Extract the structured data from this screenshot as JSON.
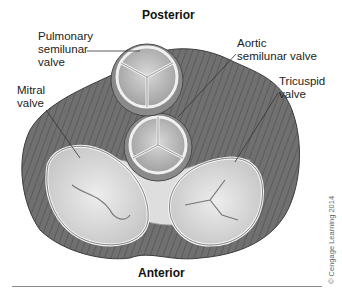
{
  "figure": {
    "orientation_top": "Posterior",
    "orientation_bottom": "Anterior",
    "credit": "© Cengage Learning 2014",
    "labels": {
      "pulmonary": "Pulmonary\nsemilunar\nvalve",
      "aortic": "Aortic\nsemilunar valve",
      "mitral": "Mitral\nvalve",
      "tricuspid": "Tricuspid\nvalve"
    },
    "colors": {
      "muscle": "#6e6e6e",
      "muscle_stripe": "#4f4f4f",
      "skeleton": "#d6d6d6",
      "valve_face": "#c9c9c9",
      "valve_rim": "#eeeeee",
      "leaflet_light": "#dcdcdc"
    }
  }
}
